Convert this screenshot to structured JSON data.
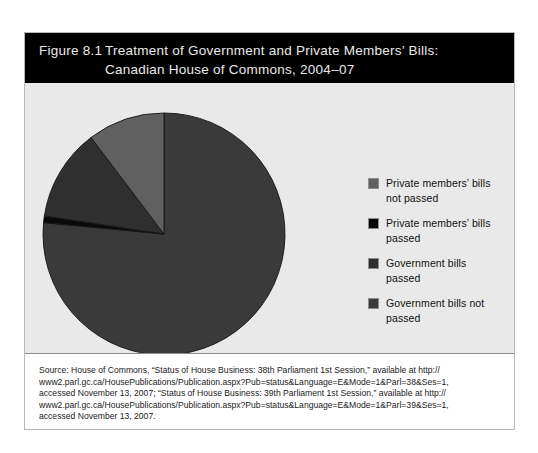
{
  "figure": {
    "number_label": "Figure 8.1",
    "title_line1": "Treatment of Government and Private Members’ Bills:",
    "title_line2": "Canadian House of Commons, 2004–07",
    "header_bg": "#000000",
    "header_text_color": "#e9e9e9",
    "body_bg": "#e9e9e9"
  },
  "legend": {
    "items": [
      {
        "label": "Private members’ bills not passed",
        "color": "#606060"
      },
      {
        "label": "Private members’ bills passed",
        "color": "#0a0a0a"
      },
      {
        "label": "Government bills passed",
        "color": "#2f2f2f"
      },
      {
        "label": "Government bills not passed",
        "color": "#3a3a3a"
      }
    ]
  },
  "source": {
    "lines": [
      "Source: House of Commons, “Status of House Business: 38th Parliament 1st Session,” available at http://",
      "www2.parl.gc.ca/HousePublications/Publication.aspx?Pub=status&Language=E&Mode=1&Parl=38&Ses=1,",
      "accessed November 13, 2007; “Status of House Business: 39th Parliament 1st Session,” available at http://",
      "www2.parl.gc.ca/HousePublications/Publication.aspx?Pub=status&Language=E&Mode=1&Parl=39&Ses=1,",
      "accessed November 13, 2007."
    ]
  },
  "chart_data": {
    "type": "pie",
    "title": "Treatment of Government and Private Members’ Bills: Canadian House of Commons, 2004–07",
    "legend_position": "right",
    "start_angle_deg": 0,
    "direction": "clockwise",
    "categories": [
      "Government bills not passed",
      "Private members’ bills passed",
      "Government bills passed",
      "Private members’ bills not passed"
    ],
    "values": [
      76.5,
      0.9,
      12.3,
      10.3
    ],
    "units": "percent",
    "colors": [
      "#3a3a3a",
      "#0a0a0a",
      "#2f2f2f",
      "#606060"
    ],
    "slice_order_clockwise_from_12": [
      {
        "name": "Government bills not passed",
        "percent": 76.5,
        "angle_deg": 275.4,
        "color": "#3a3a3a"
      },
      {
        "name": "Private members’ bills passed",
        "percent": 0.9,
        "angle_deg": 3.2,
        "color": "#0a0a0a"
      },
      {
        "name": "Government bills passed",
        "percent": 12.3,
        "angle_deg": 44.3,
        "color": "#2f2f2f"
      },
      {
        "name": "Private members’ bills not passed",
        "percent": 10.3,
        "angle_deg": 37.1,
        "color": "#606060"
      }
    ]
  }
}
